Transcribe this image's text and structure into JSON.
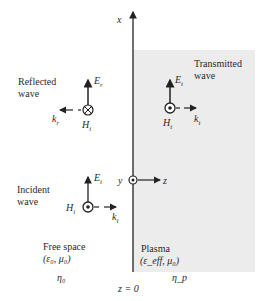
{
  "diagram": {
    "axes": {
      "x_label": "x",
      "y_label": "y",
      "z_label": "z",
      "boundary_label": "z = 0"
    },
    "reflected": {
      "title_line1": "Reflected",
      "title_line2": "wave",
      "E": "E",
      "E_sub": "r",
      "H": "H",
      "H_sub": "i",
      "k": "k",
      "k_sub": "r"
    },
    "transmitted": {
      "title_line1": "Transmitted",
      "title_line2": "wave",
      "E": "E",
      "E_sub": "t",
      "H": "H",
      "H_sub": "t",
      "k": "k",
      "k_sub": "t"
    },
    "incident": {
      "title_line1": "Incident",
      "title_line2": "wave",
      "E": "E",
      "E_sub": "i",
      "H": "H",
      "H_sub": "i",
      "k": "k",
      "k_sub": "i"
    },
    "free_space": {
      "label": "Free space",
      "params": "(ε₀, μ₀)",
      "impedance": "η₀"
    },
    "plasma": {
      "label": "Plasma",
      "params": "(ε_eff, μ₀)",
      "impedance": "η_p"
    },
    "colors": {
      "plasma_fill": "#ececec",
      "ink": "#222222"
    }
  }
}
